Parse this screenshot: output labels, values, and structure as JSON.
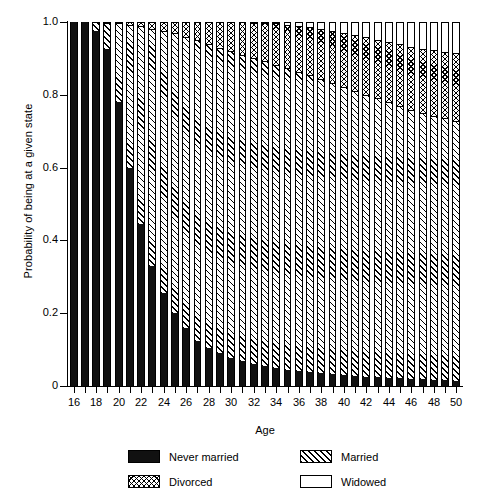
{
  "chart_data": {
    "type": "bar",
    "subtype": "stacked-bar-100",
    "title": "",
    "xlabel": "Age",
    "ylabel": "Probability of being at a given state",
    "xlim": [
      15.5,
      50.5
    ],
    "ylim": [
      0,
      1
    ],
    "grid": false,
    "legend_position": "bottom",
    "y_ticks": [
      "0",
      "0.2",
      "0.4",
      "0.6",
      "0.8",
      "1.0"
    ],
    "y_tick_values": [
      0,
      0.2,
      0.4,
      0.6,
      0.8,
      1.0
    ],
    "x_ticks_all": [
      16,
      17,
      18,
      19,
      20,
      21,
      22,
      23,
      24,
      25,
      26,
      27,
      28,
      29,
      30,
      31,
      32,
      33,
      34,
      35,
      36,
      37,
      38,
      39,
      40,
      41,
      42,
      43,
      44,
      45,
      46,
      47,
      48,
      49,
      50
    ],
    "x_tick_labels": [
      "16",
      "",
      "18",
      "",
      "20",
      "",
      "22",
      "",
      "24",
      "",
      "26",
      "",
      "28",
      "",
      "30",
      "",
      "32",
      "",
      "34",
      "",
      "36",
      "",
      "38",
      "",
      "40",
      "",
      "42",
      "",
      "44",
      "",
      "46",
      "",
      "48",
      "",
      "50"
    ],
    "categories": [
      16,
      17,
      18,
      19,
      20,
      21,
      22,
      23,
      24,
      25,
      26,
      27,
      28,
      29,
      30,
      31,
      32,
      33,
      34,
      35,
      36,
      37,
      38,
      39,
      40,
      41,
      42,
      43,
      44,
      45,
      46,
      47,
      48,
      49,
      50
    ],
    "series": [
      {
        "name": "Never married",
        "pattern": "solid-black",
        "values": [
          1.0,
          1.0,
          0.975,
          0.925,
          0.78,
          0.6,
          0.445,
          0.33,
          0.255,
          0.2,
          0.16,
          0.125,
          0.105,
          0.09,
          0.078,
          0.068,
          0.06,
          0.054,
          0.049,
          0.045,
          0.041,
          0.038,
          0.035,
          0.033,
          0.03,
          0.028,
          0.026,
          0.024,
          0.022,
          0.021,
          0.019,
          0.018,
          0.017,
          0.016,
          0.015
        ]
      },
      {
        "name": "Married",
        "pattern": "diagonal-hatch",
        "values": [
          0.0,
          0.0,
          0.024,
          0.073,
          0.216,
          0.393,
          0.543,
          0.652,
          0.721,
          0.769,
          0.8,
          0.826,
          0.835,
          0.84,
          0.842,
          0.842,
          0.84,
          0.838,
          0.834,
          0.828,
          0.822,
          0.816,
          0.808,
          0.799,
          0.791,
          0.782,
          0.774,
          0.766,
          0.757,
          0.748,
          0.74,
          0.733,
          0.726,
          0.72,
          0.714
        ]
      },
      {
        "name": "Divorced",
        "pattern": "cross-hatch",
        "values": [
          0.0,
          0.0,
          0.001,
          0.002,
          0.004,
          0.007,
          0.012,
          0.018,
          0.024,
          0.031,
          0.04,
          0.049,
          0.06,
          0.07,
          0.08,
          0.09,
          0.098,
          0.106,
          0.113,
          0.12,
          0.127,
          0.133,
          0.139,
          0.144,
          0.149,
          0.154,
          0.158,
          0.162,
          0.166,
          0.17,
          0.173,
          0.176,
          0.179,
          0.182,
          0.185
        ]
      },
      {
        "name": "Widowed",
        "pattern": "white",
        "values": [
          0.0,
          0.0,
          0.0,
          0.0,
          0.0,
          0.0,
          0.0,
          0.0,
          0.0,
          0.0,
          0.0,
          0.0,
          0.0,
          0.0,
          0.0,
          0.0,
          0.002,
          0.002,
          0.004,
          0.007,
          0.01,
          0.013,
          0.018,
          0.024,
          0.03,
          0.036,
          0.042,
          0.048,
          0.055,
          0.061,
          0.068,
          0.073,
          0.078,
          0.082,
          0.086
        ]
      }
    ]
  },
  "legend": {
    "entries": [
      {
        "label": "Never married",
        "pattern": "never"
      },
      {
        "label": "Married",
        "pattern": "married"
      },
      {
        "label": "Divorced",
        "pattern": "divorced"
      },
      {
        "label": "Widowed",
        "pattern": "widowed"
      }
    ]
  },
  "colors": {
    "ink": "#000000",
    "never_married": "#111111",
    "background": "#ffffff"
  }
}
